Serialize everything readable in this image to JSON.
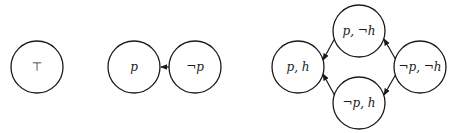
{
  "diagrams": [
    {
      "nodes": [
        {
          "id": "top",
          "label": "⊤",
          "cx": 37,
          "cy": 67
        }
      ],
      "edges": []
    },
    {
      "nodes": [
        {
          "id": "p",
          "label": "p",
          "cx": 134,
          "cy": 67
        },
        {
          "id": "not_p",
          "label": "¬p",
          "cx": 195,
          "cy": 67
        }
      ],
      "edges": [
        {
          "from": "not_p",
          "to": "p"
        }
      ]
    },
    {
      "nodes": [
        {
          "id": "p_h",
          "label": "p, h",
          "cx": 298,
          "cy": 67
        },
        {
          "id": "p_not_h",
          "label": "p, ¬h",
          "cx": 359,
          "cy": 31
        },
        {
          "id": "not_p_h",
          "label": "¬p, h",
          "cx": 359,
          "cy": 103
        },
        {
          "id": "not_p_not_h",
          "label": "¬p, ¬h",
          "cx": 420,
          "cy": 67
        }
      ],
      "edges": [
        {
          "from": "p_not_h",
          "to": "p_h"
        },
        {
          "from": "not_p_h",
          "to": "p_h"
        },
        {
          "from": "not_p_not_h",
          "to": "p_not_h"
        },
        {
          "from": "not_p_not_h",
          "to": "not_p_h"
        }
      ]
    }
  ],
  "node_radius": 26
}
